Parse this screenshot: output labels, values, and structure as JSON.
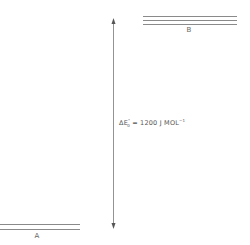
{
  "levels": [
    {
      "id": "A",
      "label": "A",
      "lines": 2
    },
    {
      "id": "B",
      "label": "B",
      "lines": 3
    }
  ],
  "energy_gap": {
    "symbol": "ΔE",
    "subscript": "0",
    "superscript": "°",
    "equals": " = 1200  J  MOL",
    "unit_superscript": "−1"
  },
  "colors": {
    "line": "#8a8a8a",
    "text": "#555555"
  }
}
